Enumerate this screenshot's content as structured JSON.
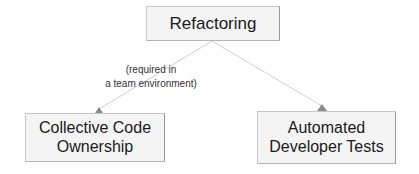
{
  "diagram": {
    "type": "concept-dependency",
    "nodes": [
      {
        "id": "refactoring",
        "label": "Refactoring"
      },
      {
        "id": "collective-code-ownership",
        "label_lines": [
          "Collective Code",
          "Ownership"
        ]
      },
      {
        "id": "automated-developer-tests",
        "label_lines": [
          "Automated",
          "Developer Tests"
        ]
      }
    ],
    "edges": [
      {
        "from": "refactoring",
        "to": "collective-code-ownership",
        "label_lines": [
          "(required in",
          "a team environment)"
        ]
      },
      {
        "from": "refactoring",
        "to": "automated-developer-tests",
        "label_lines": []
      }
    ]
  },
  "colors": {
    "node_fill": "#f4f4f4",
    "node_border": "#c8c8c8",
    "edge": "#c9c9c9",
    "arrowhead": "#8a8a8a",
    "text": "#1a1a1a",
    "label_text": "#333333"
  }
}
